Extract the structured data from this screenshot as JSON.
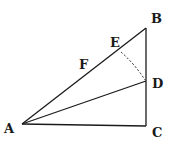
{
  "diagram": {
    "type": "geometry",
    "colors": {
      "stroke": "#1a1a1a",
      "background": "#ffffff"
    },
    "points": {
      "A": {
        "label": "A",
        "x": 22,
        "y": 124
      },
      "B": {
        "label": "B",
        "x": 146,
        "y": 28
      },
      "C": {
        "label": "C",
        "x": 146,
        "y": 126
      },
      "D": {
        "label": "D",
        "x": 146,
        "y": 81
      },
      "E": {
        "label": "E",
        "x": 121,
        "y": 48
      },
      "F": {
        "label": "F"
      }
    },
    "segments": [
      "AB",
      "BC",
      "CA",
      "AD"
    ],
    "arcs": [
      {
        "from": "D",
        "to": "E",
        "center": "A",
        "style": "dashed"
      }
    ],
    "labels": {
      "A": "A",
      "B": "B",
      "C": "C",
      "D": "D",
      "E": "E",
      "F": "F"
    }
  }
}
